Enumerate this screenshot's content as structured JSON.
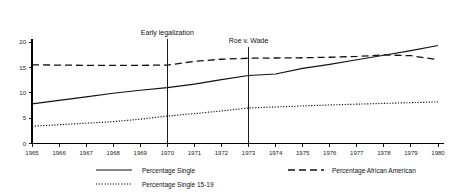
{
  "chart_data": {
    "type": "line",
    "title": "",
    "xlabel": "",
    "ylabel": "",
    "xlim": [
      1965,
      1980
    ],
    "ylim": [
      0,
      20
    ],
    "grid": false,
    "legend_position": "bottom",
    "x": [
      1965,
      1966,
      1967,
      1968,
      1969,
      1970,
      1971,
      1972,
      1973,
      1974,
      1975,
      1976,
      1977,
      1978,
      1979,
      1980
    ],
    "xtick_labels": [
      "1965",
      "1966",
      "1967",
      "1968",
      "1969",
      "1970",
      "1971",
      "1972",
      "1973",
      "1974",
      "1975",
      "1976",
      "1977",
      "1978",
      "1979",
      "1980"
    ],
    "ytick_labels": [
      "0",
      "5",
      "10",
      "15",
      "20"
    ],
    "yticks": [
      0,
      5,
      10,
      15,
      20
    ],
    "series": [
      {
        "name": "Percentage Single",
        "style": "solid",
        "values": [
          7.8,
          8.5,
          9.2,
          9.9,
          10.5,
          11.0,
          11.7,
          12.6,
          13.4,
          13.7,
          14.8,
          15.6,
          16.5,
          17.4,
          18.3,
          19.3
        ]
      },
      {
        "name": "Percentage African American",
        "style": "dashed",
        "values": [
          15.5,
          15.45,
          15.4,
          15.4,
          15.4,
          15.45,
          16.2,
          16.6,
          16.8,
          16.85,
          16.9,
          17.0,
          17.15,
          17.45,
          17.3,
          16.5
        ]
      },
      {
        "name": "Percentage Single 15-19",
        "style": "dotted",
        "values": [
          3.4,
          3.7,
          4.0,
          4.3,
          4.8,
          5.4,
          5.9,
          6.4,
          7.0,
          7.2,
          7.4,
          7.6,
          7.75,
          7.9,
          8.05,
          8.2
        ]
      }
    ],
    "annotations": [
      {
        "label": "Early legalization",
        "x": 1970,
        "y_top": 20.5
      },
      {
        "label": "Roe v. Wade",
        "x": 1973,
        "y_top": 19.0
      }
    ]
  },
  "legend": {
    "entries": [
      {
        "label": "Percentage Single",
        "style": "solid"
      },
      {
        "label": "Percentage African American",
        "style": "dashed"
      },
      {
        "label": "Percentage Single 15-19",
        "style": "dotted"
      }
    ]
  }
}
